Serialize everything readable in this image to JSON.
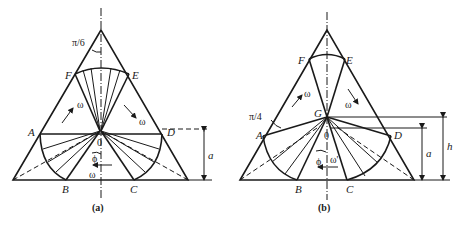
{
  "figure": {
    "panel_a": {
      "caption": "(a)",
      "points": {
        "A": "A",
        "B": "B",
        "C": "C",
        "D": "D",
        "E": "E",
        "F": "F",
        "O": "0"
      },
      "angle_label": "π/6",
      "omega": "ω",
      "phi": "ϕ",
      "dimension": "a"
    },
    "panel_b": {
      "caption": "(b)",
      "points": {
        "A": "A",
        "B": "B",
        "C": "C",
        "D": "D",
        "E": "E",
        "F": "F",
        "G": "G",
        "O": "0"
      },
      "angle_label": "π/4",
      "omega": "ω",
      "omega_prime": "ω'",
      "phi": "ϕ",
      "dimension_a": "a",
      "dimension_h": "h"
    }
  }
}
